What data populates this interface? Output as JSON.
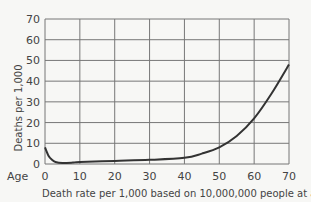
{
  "chart_data": {
    "type": "line",
    "title": "",
    "xlabel": "Death rate per 1,000 based on 10,000,000 people at age 0",
    "ylabel": "Deaths per 1,000",
    "x_prefix_label": "Age",
    "xlim": [
      0,
      70
    ],
    "ylim": [
      0,
      70
    ],
    "x_ticks": [
      0,
      10,
      20,
      30,
      40,
      50,
      60,
      70
    ],
    "y_ticks": [
      0,
      10,
      20,
      30,
      40,
      50,
      60,
      70
    ],
    "grid": true,
    "legend": null,
    "series": [
      {
        "name": "Deaths per 1,000",
        "x": [
          0,
          1,
          2,
          3,
          5,
          8,
          10,
          20,
          30,
          40,
          45,
          50,
          55,
          60,
          65,
          70
        ],
        "y": [
          8,
          4,
          2,
          1,
          0.5,
          0.7,
          1,
          1.5,
          2,
          3,
          5,
          8,
          13.5,
          22,
          34,
          48
        ]
      }
    ]
  }
}
